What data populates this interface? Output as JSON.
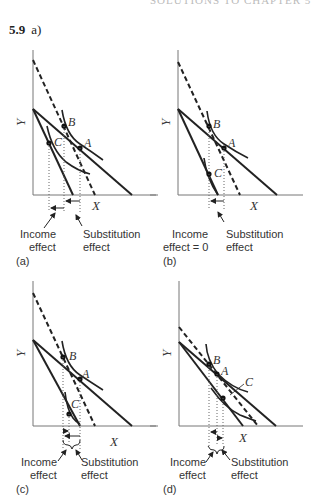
{
  "header": {
    "running_title": "SOLUTIONS TO CHAPTER 5"
  },
  "problem": {
    "number": "5.9",
    "part": "a)"
  },
  "panels": [
    {
      "id": "(a)",
      "x_axis": "X",
      "y_axis": "Y",
      "points": [
        "A",
        "B",
        "C"
      ],
      "labels": {
        "left": [
          "Income",
          "effect"
        ],
        "right": [
          "Substitution",
          "effect"
        ]
      }
    },
    {
      "id": "(b)",
      "x_axis": "X",
      "y_axis": "Y",
      "points": [
        "A",
        "B",
        "C"
      ],
      "labels": {
        "left": [
          "Income",
          "effect = 0"
        ],
        "right": [
          "Substitution",
          "effect"
        ]
      }
    },
    {
      "id": "(c)",
      "x_axis": "X",
      "y_axis": "Y",
      "points": [
        "A",
        "B",
        "C"
      ],
      "labels": {
        "left": [
          "Income",
          "effect"
        ],
        "right": [
          "Substitution",
          "effect"
        ]
      }
    },
    {
      "id": "(d)",
      "x_axis": "X",
      "y_axis": "Y",
      "points": [
        "A",
        "B",
        "C"
      ],
      "labels": {
        "left": [
          "Income",
          "effect"
        ],
        "right": [
          "Substitution",
          "effect"
        ]
      }
    }
  ]
}
